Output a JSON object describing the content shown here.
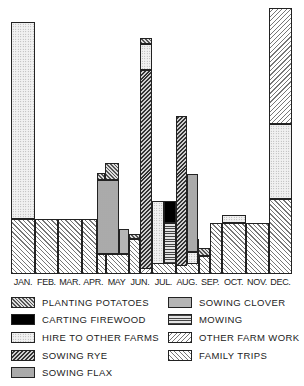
{
  "chart_data": {
    "type": "bar",
    "subtype": "stacked-overlapping",
    "title": "",
    "xlabel": "",
    "ylabel": "",
    "categories": [
      "JAN.",
      "FEB.",
      "MAR.",
      "APR.",
      "MAY",
      "JUN.",
      "JUL.",
      "AUG.",
      "SEP.",
      "OCT.",
      "NOV.",
      "DEC."
    ],
    "legend_position": "bottom",
    "grid": false,
    "units_note": "relative bar heights in pixels above baseline (axis unlabeled)",
    "ylim": [
      0,
      270
    ],
    "series": [
      {
        "name": "PLANTING POTATOES",
        "pattern": "potatoes"
      },
      {
        "name": "CARTING FIREWOOD",
        "pattern": "firewood"
      },
      {
        "name": "HIRE TO OTHER FARMS",
        "pattern": "hire"
      },
      {
        "name": "SOWING RYE",
        "pattern": "rye"
      },
      {
        "name": "SOWING FLAX",
        "pattern": "flax"
      },
      {
        "name": "SOWING CLOVER",
        "pattern": "clover"
      },
      {
        "name": "MOWING",
        "pattern": "mowing"
      },
      {
        "name": "OTHER FARM WORK",
        "pattern": "other"
      },
      {
        "name": "FAMILY TRIPS",
        "pattern": "family"
      }
    ],
    "segments": [
      {
        "month": "JAN.",
        "series": "FAMILY TRIPS",
        "x": 11,
        "w": 24,
        "y0": 0,
        "y1": 55
      },
      {
        "month": "JAN.",
        "series": "HIRE TO OTHER FARMS",
        "x": 11,
        "w": 24,
        "y0": 55,
        "y1": 252
      },
      {
        "month": "FEB.",
        "series": "FAMILY TRIPS",
        "x": 35,
        "w": 23,
        "y0": 0,
        "y1": 55
      },
      {
        "month": "MAR.",
        "series": "FAMILY TRIPS",
        "x": 58,
        "w": 24,
        "y0": 0,
        "y1": 55
      },
      {
        "month": "APR.",
        "series": "FAMILY TRIPS",
        "x": 82,
        "w": 15,
        "y0": 0,
        "y1": 55
      },
      {
        "month": "APR.",
        "series": "FAMILY TRIPS",
        "x": 97,
        "w": 9,
        "y0": 0,
        "y1": 20
      },
      {
        "month": "MAY",
        "series": "FAMILY TRIPS",
        "x": 106,
        "w": 23,
        "y0": 0,
        "y1": 20
      },
      {
        "month": "APR.",
        "series": "SOWING FLAX",
        "x": 97,
        "w": 22,
        "y0": 20,
        "y1": 94
      },
      {
        "month": "APR.",
        "series": "PLANTING POTATOES",
        "x": 97,
        "w": 8,
        "y0": 94,
        "y1": 101
      },
      {
        "month": "MAY",
        "series": "PLANTING POTATOES",
        "x": 105,
        "w": 14,
        "y0": 94,
        "y1": 111
      },
      {
        "month": "MAY",
        "series": "SOWING CLOVER",
        "x": 119,
        "w": 10,
        "y0": 20,
        "y1": 45
      },
      {
        "month": "MAY",
        "series": "FAMILY TRIPS",
        "x": 129,
        "w": 11,
        "y0": 0,
        "y1": 35
      },
      {
        "month": "MAY",
        "series": "PLANTING POTATOES",
        "x": 129,
        "w": 11,
        "y0": 35,
        "y1": 40
      },
      {
        "month": "JUN.",
        "series": "OTHER FARM WORK",
        "x": 140,
        "w": 12,
        "y0": 0,
        "y1": 55
      },
      {
        "month": "JUN.",
        "series": "SOWING RYE",
        "x": 140,
        "w": 12,
        "y0": 5,
        "y1": 204
      },
      {
        "month": "JUN.",
        "series": "HIRE TO OTHER FARMS",
        "x": 140,
        "w": 12,
        "y0": 204,
        "y1": 230
      },
      {
        "month": "JUN.",
        "series": "PLANTING POTATOES",
        "x": 140,
        "w": 12,
        "y0": 230,
        "y1": 236
      },
      {
        "month": "JUL.",
        "series": "FAMILY TRIPS",
        "x": 152,
        "w": 24,
        "y0": 0,
        "y1": 35
      },
      {
        "month": "JUL.",
        "series": "HIRE TO OTHER FARMS",
        "x": 152,
        "w": 12,
        "y0": 10,
        "y1": 73
      },
      {
        "month": "JUL.",
        "series": "MOWING",
        "x": 164,
        "w": 12,
        "y0": 10,
        "y1": 51
      },
      {
        "month": "JUL.",
        "series": "CARTING FIREWOOD",
        "x": 164,
        "w": 12,
        "y0": 51,
        "y1": 73
      },
      {
        "month": "AUG.",
        "series": "FAMILY TRIPS",
        "x": 176,
        "w": 23,
        "y0": 0,
        "y1": 35
      },
      {
        "month": "AUG.",
        "series": "SOWING RYE",
        "x": 176,
        "w": 11,
        "y0": 8,
        "y1": 158
      },
      {
        "month": "AUG.",
        "series": "SOWING FLAX",
        "x": 187,
        "w": 11,
        "y0": 22,
        "y1": 100
      },
      {
        "month": "AUG.",
        "series": "HIRE TO OTHER FARMS",
        "x": 187,
        "w": 11,
        "y0": 10,
        "y1": 22
      },
      {
        "month": "SEP.",
        "series": "PLANTING POTATOES",
        "x": 198,
        "w": 12,
        "y0": 18,
        "y1": 26
      },
      {
        "month": "SEP.",
        "series": "FAMILY TRIPS",
        "x": 199,
        "w": 11,
        "y0": 0,
        "y1": 18
      },
      {
        "month": "SEP.",
        "series": "FAMILY TRIPS",
        "x": 210,
        "w": 12,
        "y0": 0,
        "y1": 51
      },
      {
        "month": "OCT.",
        "series": "FAMILY TRIPS",
        "x": 222,
        "w": 24,
        "y0": 0,
        "y1": 51
      },
      {
        "month": "OCT.",
        "series": "HIRE TO OTHER FARMS",
        "x": 222,
        "w": 24,
        "y0": 51,
        "y1": 59
      },
      {
        "month": "NOV.",
        "series": "FAMILY TRIPS",
        "x": 246,
        "w": 23,
        "y0": 0,
        "y1": 51
      },
      {
        "month": "DEC.",
        "series": "FAMILY TRIPS",
        "x": 269,
        "w": 23,
        "y0": 0,
        "y1": 75
      },
      {
        "month": "DEC.",
        "series": "HIRE TO OTHER FARMS",
        "x": 269,
        "w": 23,
        "y0": 75,
        "y1": 150
      },
      {
        "month": "DEC.",
        "series": "OTHER FARM WORK",
        "x": 269,
        "w": 23,
        "y0": 150,
        "y1": 266
      }
    ]
  },
  "legend": {
    "left": [
      {
        "label": "PLANTING POTATOES",
        "pattern": "potatoes"
      },
      {
        "label": "CARTING FIREWOOD",
        "pattern": "firewood"
      },
      {
        "label": "HIRE TO OTHER FARMS",
        "pattern": "hire"
      },
      {
        "label": "SOWING RYE",
        "pattern": "rye"
      },
      {
        "label": "SOWING FLAX",
        "pattern": "flax"
      }
    ],
    "right": [
      {
        "label": "SOWING CLOVER",
        "pattern": "clover"
      },
      {
        "label": "MOWING",
        "pattern": "mowing"
      },
      {
        "label": "OTHER FARM WORK",
        "pattern": "other"
      },
      {
        "label": "FAMILY TRIPS",
        "pattern": "family"
      }
    ]
  }
}
